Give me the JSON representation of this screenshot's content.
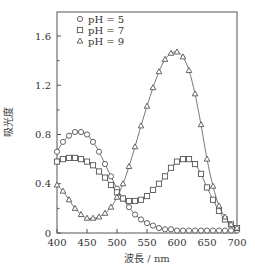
{
  "chart_data": {
    "type": "line",
    "title": "",
    "xlabel": "波長 / nm",
    "ylabel": "吸光度",
    "xlim": [
      400,
      700
    ],
    "ylim": [
      0,
      1.75
    ],
    "xticks": [
      400,
      450,
      500,
      550,
      600,
      650,
      700
    ],
    "yticks": [
      0,
      0.4,
      0.8,
      1.2,
      1.6
    ],
    "ytick_labels": [
      "0",
      "0.4",
      "0.8",
      "1.2",
      "1.6"
    ],
    "grid": false,
    "legend_position": "upper-left",
    "x": [
      400,
      410,
      420,
      430,
      440,
      450,
      460,
      470,
      480,
      490,
      500,
      510,
      520,
      530,
      540,
      550,
      560,
      570,
      580,
      590,
      600,
      610,
      620,
      630,
      640,
      650,
      660,
      670,
      680,
      690,
      700
    ],
    "series": [
      {
        "name": "pH = 5",
        "marker": "circle",
        "values": [
          0.66,
          0.74,
          0.79,
          0.82,
          0.82,
          0.8,
          0.74,
          0.66,
          0.56,
          0.46,
          0.36,
          0.28,
          0.21,
          0.15,
          0.11,
          0.08,
          0.06,
          0.04,
          0.03,
          0.03,
          0.02,
          0.02,
          0.02,
          0.02,
          0.02,
          0.02,
          0.02,
          0.02,
          0.02,
          0.02,
          0.02
        ]
      },
      {
        "name": "pH = 7",
        "marker": "square",
        "values": [
          0.58,
          0.6,
          0.61,
          0.61,
          0.6,
          0.58,
          0.55,
          0.5,
          0.45,
          0.39,
          0.33,
          0.28,
          0.26,
          0.26,
          0.27,
          0.3,
          0.35,
          0.4,
          0.46,
          0.53,
          0.58,
          0.6,
          0.6,
          0.56,
          0.48,
          0.37,
          0.27,
          0.18,
          0.11,
          0.07,
          0.04
        ]
      },
      {
        "name": "pH = 9",
        "marker": "triangle",
        "values": [
          0.39,
          0.34,
          0.27,
          0.2,
          0.15,
          0.12,
          0.12,
          0.13,
          0.16,
          0.21,
          0.29,
          0.4,
          0.54,
          0.7,
          0.87,
          1.03,
          1.18,
          1.31,
          1.41,
          1.46,
          1.47,
          1.43,
          1.32,
          1.13,
          0.88,
          0.6,
          0.38,
          0.22,
          0.13,
          0.07,
          0.04
        ]
      }
    ]
  },
  "legend": {
    "items": [
      {
        "label": "pH = 5",
        "marker": "circle"
      },
      {
        "label": "pH = 7",
        "marker": "square"
      },
      {
        "label": "pH = 9",
        "marker": "triangle"
      }
    ]
  },
  "colors": {
    "line": "#555555",
    "marker": "#555555",
    "axis": "#555555"
  }
}
